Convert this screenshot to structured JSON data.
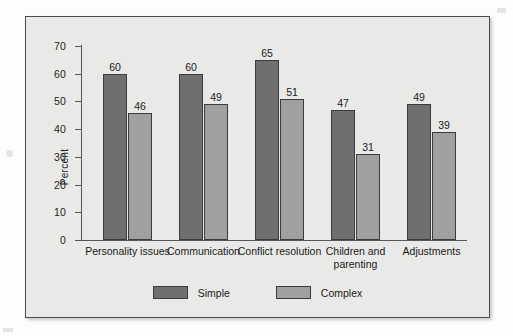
{
  "chart_data": {
    "type": "bar",
    "title": "",
    "xlabel": "",
    "ylabel": "Percent",
    "ylim": [
      0,
      70
    ],
    "ytick_values": [
      0,
      10,
      20,
      30,
      40,
      50,
      60,
      70
    ],
    "ytick_labels": [
      "0",
      "10",
      "20",
      "30",
      "40",
      "50",
      "60",
      "70"
    ],
    "grid": false,
    "legend_position": "bottom-center",
    "categories": [
      "Personality issues",
      "Communication",
      "Conflict resolution",
      "Children and parenting",
      "Adjustments"
    ],
    "series": [
      {
        "name": "Simple",
        "color": "#6f6f6f",
        "values": [
          60,
          60,
          65,
          47,
          49
        ],
        "labels": [
          "60",
          "60",
          "65",
          "47",
          "49"
        ]
      },
      {
        "name": "Complex",
        "color": "#a0a0a0",
        "values": [
          46,
          49,
          51,
          31,
          39
        ],
        "labels": [
          "46",
          "49",
          "51",
          "31",
          "39"
        ]
      }
    ]
  },
  "legend": {
    "items": [
      {
        "label": "Simple",
        "color": "#6f6f6f"
      },
      {
        "label": "Complex",
        "color": "#a0a0a0"
      }
    ]
  },
  "colors": {
    "simple": "#6f6f6f",
    "complex": "#a0a0a0",
    "frame_background": "#e9e9e7",
    "frame_border": "#4d4d4d",
    "axis": "#57575a",
    "text": "#1a1a1a"
  }
}
